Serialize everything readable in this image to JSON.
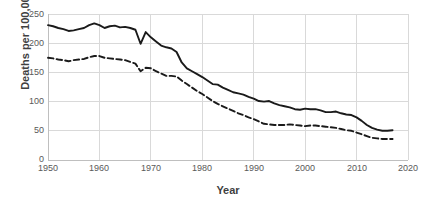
{
  "chart_data": {
    "type": "line",
    "title": "",
    "xlabel": "Year",
    "ylabel": "Deaths per 100,000",
    "xlim": [
      1950,
      2020
    ],
    "ylim": [
      0,
      250
    ],
    "xticks": [
      1950,
      1960,
      1970,
      1980,
      1990,
      2000,
      2010,
      2020
    ],
    "yticks": [
      0,
      50,
      100,
      150,
      200,
      250
    ],
    "grid": true,
    "legend": "none",
    "x": [
      1950,
      1951,
      1952,
      1953,
      1954,
      1955,
      1956,
      1957,
      1958,
      1959,
      1960,
      1961,
      1962,
      1963,
      1964,
      1965,
      1966,
      1967,
      1968,
      1969,
      1970,
      1971,
      1972,
      1973,
      1974,
      1975,
      1976,
      1977,
      1978,
      1979,
      1980,
      1981,
      1982,
      1983,
      1984,
      1985,
      1986,
      1987,
      1988,
      1989,
      1990,
      1991,
      1992,
      1993,
      1994,
      1995,
      1996,
      1997,
      1998,
      1999,
      2000,
      2001,
      2002,
      2003,
      2004,
      2005,
      2006,
      2007,
      2008,
      2009,
      2010,
      2011,
      2012,
      2013,
      2014,
      2015,
      2016,
      2017
    ],
    "series": [
      {
        "name": "solid-series",
        "style": "solid",
        "color": "#1a1a1a",
        "values": [
          231,
          229,
          226,
          224,
          221,
          222,
          224,
          226,
          231,
          234,
          231,
          226,
          229,
          230,
          227,
          228,
          226,
          223,
          199,
          219,
          210,
          203,
          196,
          193,
          191,
          185,
          167,
          157,
          152,
          147,
          142,
          136,
          130,
          129,
          124,
          120,
          116,
          114,
          112,
          108,
          105,
          101,
          100,
          101,
          97,
          94,
          92,
          90,
          87,
          86,
          88,
          87,
          87,
          85,
          82,
          82,
          83,
          80,
          78,
          77,
          73,
          67,
          60,
          55,
          52,
          50,
          50,
          51
        ]
      },
      {
        "name": "dashed-series",
        "style": "dashed",
        "color": "#1a1a1a",
        "values": [
          175,
          174,
          172,
          171,
          169,
          171,
          172,
          173,
          176,
          178,
          178,
          175,
          174,
          173,
          172,
          171,
          168,
          165,
          152,
          158,
          157,
          152,
          148,
          144,
          144,
          143,
          136,
          130,
          124,
          118,
          113,
          107,
          101,
          96,
          92,
          88,
          84,
          80,
          77,
          73,
          70,
          66,
          62,
          61,
          60,
          60,
          60,
          61,
          60,
          59,
          58,
          59,
          59,
          58,
          57,
          56,
          55,
          53,
          51,
          50,
          47,
          44,
          41,
          38,
          37,
          36,
          36,
          36
        ]
      }
    ]
  },
  "axes": {
    "y_title": "Deaths per 100,000",
    "x_title": "Year",
    "yticks": [
      "0",
      "50",
      "100",
      "150",
      "200",
      "250"
    ],
    "xticks": [
      "1950",
      "1960",
      "1970",
      "1980",
      "1990",
      "2000",
      "2010",
      "2020"
    ]
  },
  "colors": {
    "line": "#1a1a1a",
    "grid": "#d9d9d9",
    "axis": "#bfbfbf",
    "tick_text": "#595959",
    "title_text": "#3f3f3f",
    "background": "#ffffff"
  }
}
